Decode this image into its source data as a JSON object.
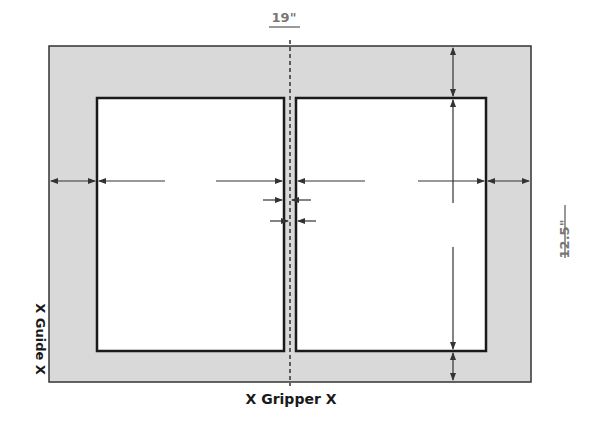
{
  "diagram": {
    "width_label": "19\"",
    "height_label": "12.5\"",
    "gripper_label": "X Gripper X",
    "guide_label": "X Guide X",
    "colors": {
      "sheet_fill": "#d9d9d9",
      "sheet_stroke": "#333333",
      "page_fill": "#ffffff",
      "page_stroke": "#1a1a1a",
      "arrow": "#333333",
      "dim_text": "#777777",
      "label_text": "#1a1a1a"
    },
    "sheet": {
      "width_in": 19,
      "height_in": 12.5
    },
    "pages": [
      {
        "name": "left-page"
      },
      {
        "name": "right-page"
      }
    ]
  }
}
